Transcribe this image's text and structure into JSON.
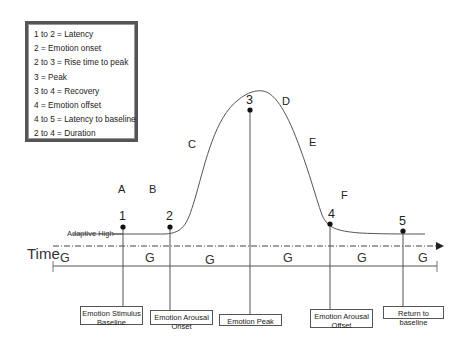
{
  "legend": {
    "items": [
      "1 to 2 = Latency",
      "2 = Emotion onset",
      "2 to 3 = Rise time to peak",
      "3 = Peak",
      "3 to 4 = Recovery",
      "4 = Emotion offset",
      "4 to 5 = Latency to baseline",
      "2 to 4 = Duration"
    ]
  },
  "region_letters": {
    "A": "A",
    "B": "B",
    "C": "C",
    "D": "D",
    "E": "E",
    "F": "F"
  },
  "points": [
    "1",
    "2",
    "3",
    "4",
    "5"
  ],
  "axis": {
    "time_label": "Time",
    "baseline_label": "Adaptive High",
    "g_labels": [
      "G",
      "G",
      "G",
      "G",
      "G",
      "G"
    ]
  },
  "boxes": [
    {
      "line1": "Emotion Stimulus",
      "line2": "Baseline"
    },
    {
      "line1": "Emotion Arousal",
      "line2": "Onset"
    },
    {
      "line1": "Emotion Peak",
      "line2": ""
    },
    {
      "line1": "Emotion Arousal",
      "line2": "Offset"
    },
    {
      "line1": "Return to baseline",
      "line2": ""
    }
  ]
}
